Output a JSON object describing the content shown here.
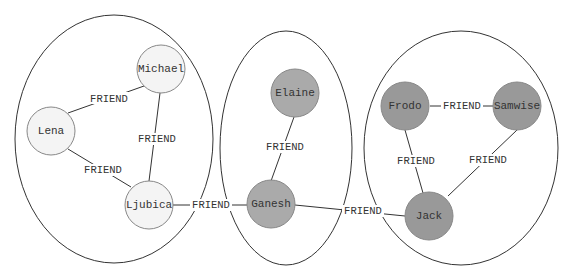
{
  "diagram": {
    "title": "",
    "colors": {
      "community_a_fill": "#f4f4f4",
      "community_b_fill": "#aaaaaa",
      "community_c_fill": "#999999",
      "stroke": "#333333",
      "node_stroke": "#888888"
    },
    "clusters": [
      {
        "id": "community-1",
        "members": [
          "Michael",
          "Lena",
          "Ljubica"
        ]
      },
      {
        "id": "community-2",
        "members": [
          "Elaine",
          "Ganesh"
        ]
      },
      {
        "id": "community-3",
        "members": [
          "Frodo",
          "Samwise",
          "Jack"
        ]
      }
    ],
    "nodes": [
      {
        "id": "michael",
        "label": "Michael"
      },
      {
        "id": "lena",
        "label": "Lena"
      },
      {
        "id": "ljubica",
        "label": "Ljubica"
      },
      {
        "id": "elaine",
        "label": "Elaine"
      },
      {
        "id": "ganesh",
        "label": "Ganesh"
      },
      {
        "id": "frodo",
        "label": "Frodo"
      },
      {
        "id": "samwise",
        "label": "Samwise"
      },
      {
        "id": "jack",
        "label": "Jack"
      }
    ],
    "edges": [
      {
        "from": "Lena",
        "to": "Michael",
        "label": "FRIEND"
      },
      {
        "from": "Michael",
        "to": "Ljubica",
        "label": "FRIEND"
      },
      {
        "from": "Lena",
        "to": "Ljubica",
        "label": "FRIEND"
      },
      {
        "from": "Ljubica",
        "to": "Ganesh",
        "label": "FRIEND"
      },
      {
        "from": "Elaine",
        "to": "Ganesh",
        "label": "FRIEND"
      },
      {
        "from": "Ganesh",
        "to": "Jack",
        "label": "FRIEND"
      },
      {
        "from": "Frodo",
        "to": "Samwise",
        "label": "FRIEND"
      },
      {
        "from": "Frodo",
        "to": "Jack",
        "label": "FRIEND"
      },
      {
        "from": "Samwise",
        "to": "Jack",
        "label": "FRIEND"
      }
    ]
  }
}
